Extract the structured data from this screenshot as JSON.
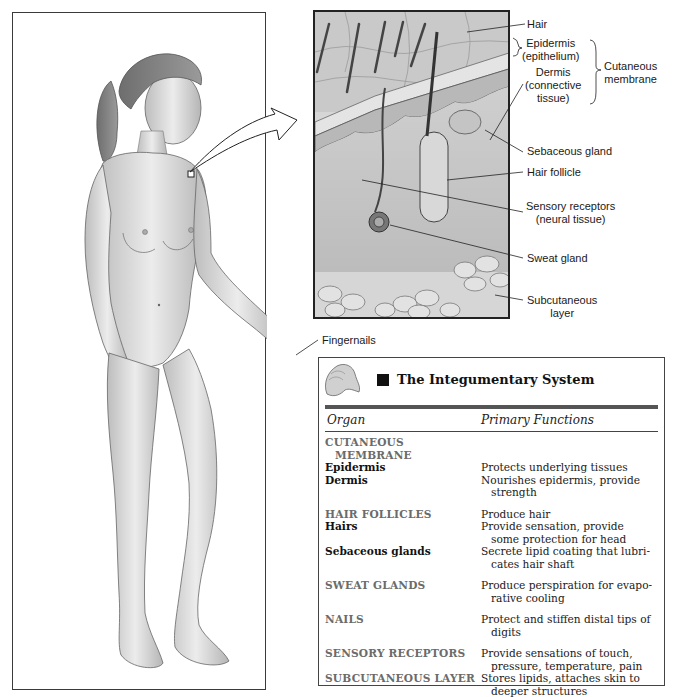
{
  "figure": {
    "connector_target": "skin-inset"
  },
  "inset_labels": {
    "hair": "Hair",
    "epidermis": "Epidermis",
    "epidermis_sub": "(epithelium)",
    "dermis": "Dermis",
    "dermis_sub1": "(connective",
    "dermis_sub2": "tissue)",
    "cutaneous": "Cutaneous",
    "cutaneous_sub": "membrane",
    "sebaceous": "Sebaceous gland",
    "hair_follicle": "Hair follicle",
    "sensory": "Sensory receptors",
    "sensory_sub": "(neural tissue)",
    "sweat": "Sweat gland",
    "subcutaneous": "Subcutaneous",
    "subcutaneous_sub": "layer"
  },
  "fingernails_label": "Fingernails",
  "table": {
    "title": "The Integumentary System",
    "col_organ": "Organ",
    "col_functions": "Primary Functions",
    "rows": [
      {
        "organ": "CUTANEOUS",
        "type": "cat",
        "func": ""
      },
      {
        "organ": "MEMBRANE",
        "type": "cat-cont",
        "func": ""
      },
      {
        "organ": "Epidermis",
        "type": "sub",
        "func": "Protects underlying tissues"
      },
      {
        "organ": "Dermis",
        "type": "sub",
        "func": "Nourishes epidermis, provide"
      },
      {
        "organ": "",
        "type": "cont",
        "func": "strength"
      },
      {
        "organ": "HAIR FOLLICLES",
        "type": "cat",
        "func": "Produce hair"
      },
      {
        "organ": "Hairs",
        "type": "sub",
        "func": "Provide sensation, provide"
      },
      {
        "organ": "",
        "type": "cont",
        "func": "some protection for head"
      },
      {
        "organ": "Sebaceous glands",
        "type": "sub",
        "func": "Secrete lipid coating that lubri-"
      },
      {
        "organ": "",
        "type": "cont",
        "func": "cates hair shaft"
      },
      {
        "organ": "SWEAT GLANDS",
        "type": "cat",
        "func": "Produce perspiration for evapo-"
      },
      {
        "organ": "",
        "type": "cont",
        "func": "rative cooling"
      },
      {
        "organ": "NAILS",
        "type": "cat",
        "func": "Protect and stiffen distal tips of"
      },
      {
        "organ": "",
        "type": "cont",
        "func": "digits"
      },
      {
        "organ": "SENSORY RECEPTORS",
        "type": "cat",
        "func": "Provide sensations of touch,"
      },
      {
        "organ": "",
        "type": "cont",
        "func": "pressure, temperature, pain"
      },
      {
        "organ": "SUBCUTANEOUS LAYER",
        "type": "cat",
        "func": "Stores lipids, attaches skin to"
      },
      {
        "organ": "",
        "type": "cont",
        "func": "deeper structures"
      }
    ]
  },
  "colors": {
    "category_text": "#6b6b6b",
    "sub_text": "#111111",
    "rule": "#555555"
  }
}
